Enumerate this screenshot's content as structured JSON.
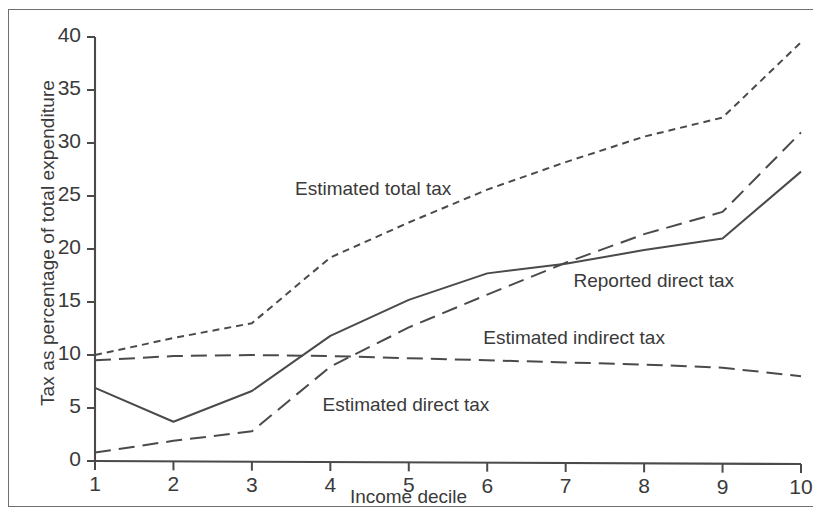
{
  "chart_data": {
    "type": "line",
    "title": "",
    "xlabel": "Income decile",
    "ylabel": "Tax as percentage of total expenditure",
    "xlim": [
      1,
      10
    ],
    "ylim": [
      0,
      40
    ],
    "grid": false,
    "legend_position": "inline-annotations",
    "x": [
      1,
      2,
      3,
      4,
      5,
      6,
      7,
      8,
      9,
      10
    ],
    "xticks": [
      "1",
      "2",
      "3",
      "4",
      "5",
      "6",
      "7",
      "8",
      "9",
      "10"
    ],
    "yticks": [
      "0",
      "5",
      "10",
      "15",
      "20",
      "25",
      "30",
      "35",
      "40"
    ],
    "series": [
      {
        "name": "Estimated total tax",
        "style": "short-dash",
        "label_x": 3.55,
        "label_y": 25.6,
        "values": [
          10.0,
          11.6,
          13.0,
          19.2,
          22.5,
          25.6,
          28.2,
          30.6,
          32.4,
          39.5
        ]
      },
      {
        "name": "Estimated direct tax",
        "style": "long-dash",
        "label_x": 3.9,
        "label_y": 5.2,
        "values": [
          0.8,
          1.9,
          2.8,
          8.9,
          12.6,
          15.7,
          18.7,
          21.4,
          23.5,
          31.0
        ]
      },
      {
        "name": "Estimated indirect tax",
        "style": "long-dash",
        "label_x": 5.95,
        "label_y": 11.5,
        "values": [
          9.5,
          9.9,
          10.0,
          9.9,
          9.7,
          9.5,
          9.3,
          9.1,
          8.8,
          8.0
        ]
      },
      {
        "name": "Reported direct tax",
        "style": "solid",
        "label_x": 7.1,
        "label_y": 16.9,
        "values": [
          6.9,
          3.7,
          6.6,
          11.8,
          15.2,
          17.7,
          18.6,
          19.9,
          21.0,
          27.3
        ]
      }
    ]
  },
  "axis": {
    "y_title": "Tax as percentage of total expenditure",
    "x_title": "Income decile"
  }
}
